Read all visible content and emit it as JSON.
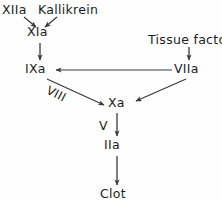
{
  "diagram": {
    "type": "flow-diagram",
    "background_color": "#fefefe",
    "line_color": "#3a3a3a",
    "text_color": "#1d1d1d",
    "nodes": [
      {
        "id": "xiia",
        "label": "XIIa",
        "x": 18,
        "y": 11
      },
      {
        "id": "kallikrein",
        "label": "Kallikrein",
        "x": 70,
        "y": 11
      },
      {
        "id": "xia",
        "label": "XIa",
        "x": 38,
        "y": 33
      },
      {
        "id": "ixa",
        "label": "IXa",
        "x": 36,
        "y": 70
      },
      {
        "id": "tissue",
        "label": "Tissue factor",
        "x": 185,
        "y": 41
      },
      {
        "id": "viia",
        "label": "VIIa",
        "x": 189,
        "y": 70
      },
      {
        "id": "xa",
        "label": "Xa",
        "x": 119,
        "y": 104
      },
      {
        "id": "iia",
        "label": "IIa",
        "x": 114,
        "y": 146
      },
      {
        "id": "clot",
        "label": "Clot",
        "x": 114,
        "y": 195
      }
    ],
    "edges": [
      {
        "id": "xiia-xia",
        "from": "xiia",
        "to": "xia",
        "label": ""
      },
      {
        "id": "kallikrein-xia",
        "from": "kallikrein",
        "to": "xia",
        "label": ""
      },
      {
        "id": "xia-ixa",
        "from": "xia",
        "to": "ixa",
        "label": ""
      },
      {
        "id": "tissue-viia",
        "from": "tissue",
        "to": "viia",
        "label": ""
      },
      {
        "id": "viia-ixa",
        "from": "viia",
        "to": "ixa",
        "label": ""
      },
      {
        "id": "ixa-xa",
        "from": "ixa",
        "to": "xa",
        "label": "VIII"
      },
      {
        "id": "viia-xa",
        "from": "viia",
        "to": "xa",
        "label": ""
      },
      {
        "id": "xa-iia",
        "from": "xa",
        "to": "iia",
        "label": "V"
      },
      {
        "id": "iia-clot",
        "from": "iia",
        "to": "clot",
        "label": ""
      }
    ],
    "edge_labels": {
      "viii": "VIII",
      "v": "V"
    }
  }
}
